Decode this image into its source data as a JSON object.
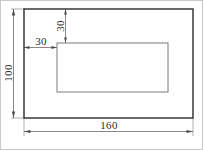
{
  "drawing": {
    "title": "Rectangular plate with rectangular cutout",
    "units": "mm",
    "colors": {
      "outline": "#2b2b2b",
      "cutout": "#7a7a7a",
      "dimension_line": "#6b6b6b",
      "extension_line": "#8d8d8d",
      "text": "#2b2b2b",
      "page_border": "#c9c9c9",
      "background": "#ffffff"
    },
    "outer_rectangle": {
      "name": "plate-outline",
      "width_value": "160",
      "height_value": "100"
    },
    "inner_rectangle": {
      "name": "cutout-outline",
      "offset_left_value": "30",
      "offset_top_value": "30"
    },
    "dimensions": [
      {
        "id": "height-100",
        "label": "100",
        "orientation": "vertical",
        "position": "left",
        "measures": "overall-height"
      },
      {
        "id": "width-160",
        "label": "160",
        "orientation": "horizontal",
        "position": "bottom",
        "measures": "overall-width"
      },
      {
        "id": "offset-left-30",
        "label": "30",
        "orientation": "horizontal",
        "position": "upper-left",
        "measures": "cutout-left-offset"
      },
      {
        "id": "offset-top-30",
        "label": "30",
        "orientation": "vertical",
        "position": "upper-middle",
        "measures": "cutout-top-offset"
      }
    ]
  }
}
